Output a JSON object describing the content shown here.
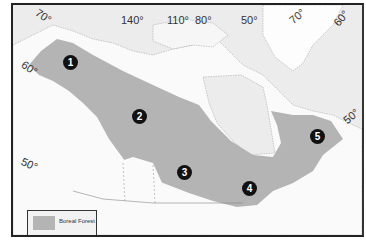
{
  "map": {
    "title": "Boreal Forest of Canada",
    "colors": {
      "water": "#ececec",
      "land": "#fafafa",
      "boreal_forest": "#b4b4b4",
      "frame": "#222222",
      "marker": "#111111"
    },
    "longitude_labels": [
      "70°",
      "140°",
      "110°",
      "80°",
      "50°",
      "70°",
      "60°"
    ],
    "latitude_labels": [
      "60°",
      "50°",
      "50°"
    ],
    "markers": [
      "1",
      "2",
      "3",
      "4",
      "5"
    ],
    "legend": {
      "items": [
        {
          "label": "Boreal Forest",
          "color": "#b4b4b4"
        }
      ]
    }
  }
}
